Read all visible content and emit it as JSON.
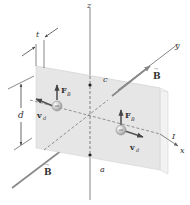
{
  "diagram": {
    "type": "physics-hall-effect",
    "labels": {
      "z_axis": "z",
      "y_axis": "y",
      "x_axis": "x",
      "thickness": "t",
      "height": "d",
      "point_c": "c",
      "point_a": "a",
      "current": "I",
      "magnetic_field_top": "B",
      "magnetic_field_bottom": "B",
      "force_left": "F",
      "force_left_sub": "B",
      "force_right": "F",
      "force_right_sub": "B",
      "velocity_left": "v",
      "velocity_left_sub": "d",
      "velocity_right": "v",
      "velocity_right_sub": "d"
    },
    "colors": {
      "slab_front": "#e6e6e6",
      "slab_side": "#f2f2f2",
      "slab_top": "#f5f5f5",
      "axis": "#777777",
      "field_arrow": "#888888",
      "charge": "#c8c8c8",
      "text": "#333333"
    }
  }
}
